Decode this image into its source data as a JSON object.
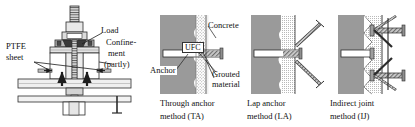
{
  "figure": {
    "left_apparatus": {
      "labels": {
        "load": "Load",
        "confinement_l1": "Confine-",
        "confinement_l2": "ment",
        "confinement_l3": "(partly)",
        "ptfe_l1": "PTFE",
        "ptfe_l2": "sheet"
      }
    },
    "panels": [
      {
        "id": "TA",
        "caption_line1": "Through anchor",
        "caption_line2": "method (TA)",
        "labels": {
          "ufc": "UFC",
          "concrete": "Concrete",
          "anchor": "Anchor",
          "grouted_l1": "Grouted",
          "grouted_l2": "material"
        }
      },
      {
        "id": "LA",
        "caption_line1": "Lap anchor",
        "caption_line2": "method (LA)",
        "labels": {}
      },
      {
        "id": "IJ",
        "caption_line1": "Indirect joint",
        "caption_line2": "method (IJ)",
        "labels": {}
      }
    ],
    "colors": {
      "concrete_gray": "#9a9a9a",
      "ufc_stipple": "#d8d8d8",
      "line": "#2b2b2b",
      "steel_fill": "#c9c9c9",
      "white": "#ffffff"
    }
  }
}
